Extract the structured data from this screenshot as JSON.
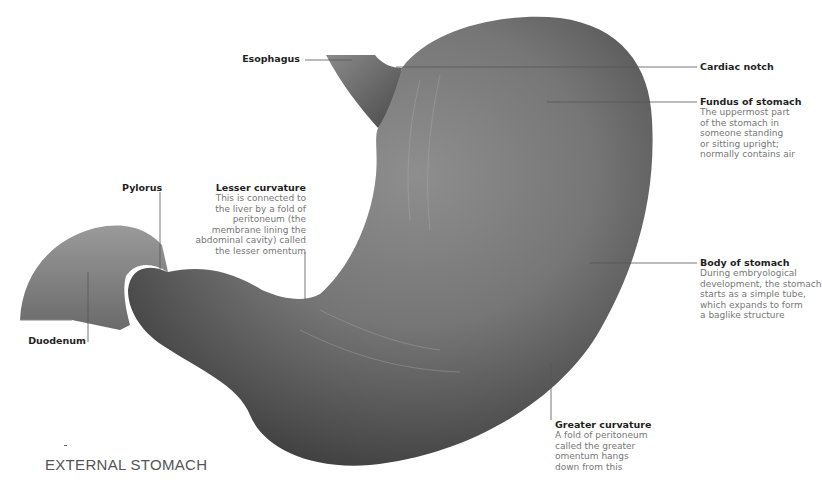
{
  "caption": "EXTERNAL STOMACH",
  "colors": {
    "leader_line": "#555555",
    "title_text": "#1f1f1f",
    "desc_text": "#777777",
    "tissue_dark": "#3a3a3a",
    "tissue_light": "#9a9a9a"
  },
  "labels": {
    "esophagus": {
      "title": "Esophagus"
    },
    "cardiac_notch": {
      "title": "Cardiac notch"
    },
    "fundus": {
      "title": "Fundus of stomach",
      "desc": [
        "The uppermost part",
        "of the stomach in",
        "someone standing",
        "or sitting upright;",
        "normally contains air"
      ]
    },
    "pylorus": {
      "title": "Pylorus"
    },
    "lesser_curvature": {
      "title": "Lesser curvature",
      "desc": [
        "This is connected to",
        "the liver by a fold of",
        "peritoneum (the",
        "membrane lining the",
        "abdominal cavity) called",
        "the lesser omentum"
      ]
    },
    "body": {
      "title": "Body of stomach",
      "desc": [
        "During embryological",
        "development, the stomach",
        "starts as a simple tube,",
        "which expands to form",
        "a baglike structure"
      ]
    },
    "duodenum": {
      "title": "Duodenum"
    },
    "greater_curvature": {
      "title": "Greater curvature",
      "desc": [
        "A fold of peritoneum",
        "called the greater",
        "omentum hangs",
        "down from this"
      ]
    }
  }
}
